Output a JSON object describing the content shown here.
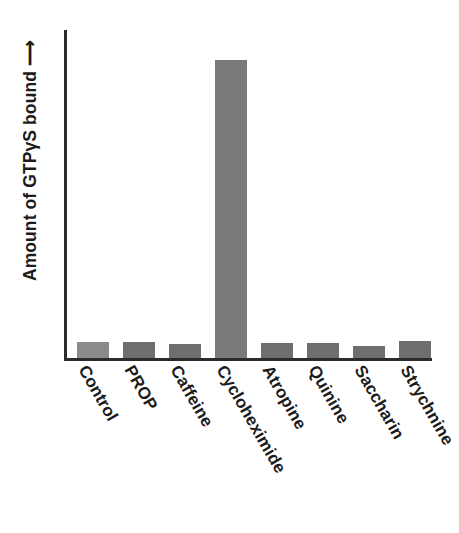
{
  "chart_data": {
    "type": "bar",
    "title": "",
    "subtitle": "",
    "xlabel": "",
    "ylabel": "Amount of GTPγS bound ⟶",
    "ylabel_has_arrow": true,
    "axis_tick_labels": [],
    "grid": false,
    "legend": "none",
    "ylim": [
      0,
      360
    ],
    "y_axis_values_shown": false,
    "categories": [
      "Control",
      "PROP",
      "Caffeine",
      "Cycloheximide",
      "Atropine",
      "Quinine",
      "Saccharin",
      "Strychnine"
    ],
    "values": [
      18,
      18,
      15,
      327,
      17,
      17,
      13,
      19
    ],
    "bar_colors": [
      "#8a8a8a",
      "#6f6f6f",
      "#6f6f6f",
      "#7a7a7a",
      "#6f6f6f",
      "#6f6f6f",
      "#6f6f6f",
      "#6f6f6f"
    ],
    "bar_left_px": [
      10,
      56,
      102,
      148,
      194,
      240,
      286,
      332
    ],
    "bar_width_px": 32,
    "annotations": []
  },
  "axes": {
    "color": "#2b2b2b",
    "x_axis_name": "category-axis",
    "y_axis_name": "value-axis"
  },
  "colors": {
    "background": "#ffffff",
    "text": "#1c1c1c",
    "bar_default": "#6f6f6f",
    "bar_control": "#8a8a8a"
  }
}
